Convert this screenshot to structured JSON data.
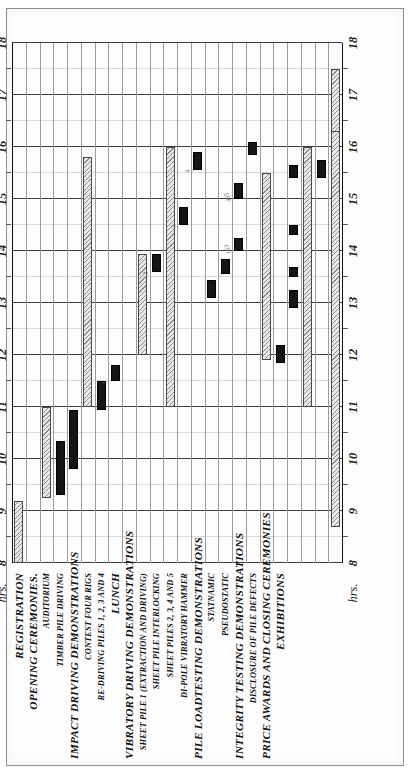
{
  "figure": {
    "axis_word": "hrs.",
    "hour_ticks": [
      "8",
      "9",
      "10",
      "11",
      "12",
      "13",
      "14",
      "15",
      "16",
      "17",
      "18"
    ]
  },
  "chart_data": {
    "type": "bar",
    "title": "",
    "xlabel": "hrs.",
    "ylabel": "",
    "xlim": [
      8,
      18
    ],
    "grid": true,
    "orientation": "horizontal-gantt",
    "legend": [],
    "categories": [
      "REGISTRATION",
      "OPENING CEREMONIES.",
      "AUDITORIUM",
      "TIMBER PILE DRIVING",
      "IMPACT DRIVING DEMONSTRATIONS",
      "CONTEST FOUR RIGS",
      "RE-DRIVING PILES 1, 2, 3 AND 4",
      "LUNCH",
      "VIBRATORY DRIVING DEMONSTRATIONS",
      "SHEET PILE 1 (EXTRACTION AND DRIVING)",
      "SHEET PILE INTERLOCKING",
      "SHEET PILES 2, 3, 4 AND 5",
      "DI-POLE VIBRATORY HAMMER",
      "PILE LOADTESTING DEMONSTRATIONS",
      "STATNAMIC",
      "PSEUDOSTATIC",
      "INTEGRITY TESTING DEMONSTRATIONS",
      "DISCLOSURE OF PILE DEFECTS",
      "PRICE AWARDS AND CLOSING CEREMONIES",
      "EXHIBITIONS"
    ],
    "rows": [
      {
        "label": "REGISTRATION",
        "level": "head",
        "row": 0,
        "bars": [
          {
            "start": 8.0,
            "end": 9.2,
            "style": "hatch"
          }
        ]
      },
      {
        "label": "OPENING CEREMONIES.",
        "level": "head",
        "row": 1,
        "bars": []
      },
      {
        "label": "AUDITORIUM",
        "level": "sub",
        "row": 2,
        "bars": [
          {
            "start": 9.25,
            "end": 11.0,
            "style": "hatch"
          }
        ]
      },
      {
        "label": "TIMBER PILE DRIVING",
        "level": "sub",
        "row": 3,
        "bars": [
          {
            "start": 9.3,
            "end": 10.35,
            "style": "solid"
          }
        ]
      },
      {
        "label": "IMPACT DRIVING DEMONSTRATIONS",
        "level": "head",
        "row": 4,
        "bars": [
          {
            "start": 9.8,
            "end": 10.95,
            "style": "solid"
          }
        ]
      },
      {
        "label": "CONTEST FOUR RIGS",
        "level": "sub",
        "row": 5,
        "bars": [
          {
            "start": 11.0,
            "end": 15.8,
            "style": "hatch"
          }
        ]
      },
      {
        "label": "RE-DRIVING PILES 1, 2, 3 AND 4",
        "level": "sub",
        "row": 6,
        "bars": [
          {
            "start": 10.95,
            "end": 11.5,
            "style": "solid"
          }
        ]
      },
      {
        "label": "LUNCH",
        "level": "head",
        "row": 7,
        "bars": [
          {
            "start": 11.5,
            "end": 11.8,
            "style": "solid",
            "annot": "1"
          }
        ]
      },
      {
        "label": "VIBRATORY DRIVING DEMONSTRATIONS",
        "level": "head",
        "row": 8,
        "bars": []
      },
      {
        "label": "SHEET PILE 1 (EXTRACTION AND DRIVING)",
        "level": "sub",
        "row": 9,
        "bars": [
          {
            "start": 12.0,
            "end": 13.95,
            "style": "hatch"
          }
        ]
      },
      {
        "label": "SHEET PILE INTERLOCKING",
        "level": "sub",
        "row": 10,
        "bars": [
          {
            "start": 13.6,
            "end": 13.95,
            "style": "solid",
            "annot": "2"
          }
        ]
      },
      {
        "label": "SHEET PILES 2, 3, 4 AND 5",
        "level": "sub",
        "row": 11,
        "bars": [
          {
            "start": 11.0,
            "end": 16.0,
            "style": "hatch"
          }
        ]
      },
      {
        "label": "DI-POLE VIBRATORY HAMMER",
        "level": "sub",
        "row": 12,
        "bars": [
          {
            "start": 14.5,
            "end": 14.85,
            "style": "solid",
            "annot": "3"
          }
        ]
      },
      {
        "label": "PILE LOADTESTING DEMONSTRATIONS",
        "level": "head",
        "row": 13,
        "bars": [
          {
            "start": 15.55,
            "end": 15.9,
            "style": "solid",
            "annot": "4"
          }
        ]
      },
      {
        "label": "STATNAMIC",
        "level": "sub",
        "row": 14,
        "bars": [
          {
            "start": 13.1,
            "end": 13.45,
            "style": "solid"
          }
        ]
      },
      {
        "label": "PSEUDOSTATIC",
        "level": "sub",
        "row": 15,
        "bars": [
          {
            "start": 13.55,
            "end": 13.85,
            "style": "solid"
          }
        ]
      },
      {
        "label": "INTEGRITY TESTING DEMONSTRATIONS",
        "level": "head",
        "row": 16,
        "bars": [
          {
            "start": 14.0,
            "end": 14.25,
            "style": "solid",
            "annot": "163"
          },
          {
            "start": 15.0,
            "end": 15.3,
            "style": "solid",
            "annot": "465"
          }
        ]
      },
      {
        "label": "DISCLOSURE OF PILE DEFECTS",
        "level": "sub",
        "row": 17,
        "bars": [
          {
            "start": 15.85,
            "end": 16.1,
            "style": "solid"
          }
        ]
      },
      {
        "label": "PRICE AWARDS AND CLOSING CEREMONIES",
        "level": "head",
        "row": 18,
        "bars": [
          {
            "start": 11.9,
            "end": 15.5,
            "style": "hatch"
          }
        ]
      },
      {
        "label": "EXHIBITIONS",
        "level": "head",
        "row": 19,
        "bars": [
          {
            "start": 11.85,
            "end": 12.2,
            "style": "solid"
          }
        ]
      },
      {
        "label": "",
        "level": "sub",
        "row": 20,
        "bars": [
          {
            "start": 12.9,
            "end": 13.25,
            "style": "solid"
          },
          {
            "start": 13.5,
            "end": 13.7,
            "style": "solid"
          },
          {
            "start": 14.3,
            "end": 14.5,
            "style": "solid"
          },
          {
            "start": 15.4,
            "end": 15.65,
            "style": "solid"
          }
        ]
      },
      {
        "label": "",
        "level": "sub",
        "row": 21,
        "bars": [
          {
            "start": 11.0,
            "end": 16.0,
            "style": "hatch"
          }
        ]
      },
      {
        "label": "",
        "level": "sub",
        "row": 22,
        "bars": [
          {
            "start": 15.4,
            "end": 15.75,
            "style": "solid"
          }
        ]
      },
      {
        "label": "",
        "level": "sub",
        "row": 23,
        "bars": [
          {
            "start": 16.0,
            "end": 17.5,
            "style": "hatch"
          },
          {
            "start": 8.7,
            "end": 16.3,
            "style": "hatch"
          }
        ]
      }
    ]
  }
}
